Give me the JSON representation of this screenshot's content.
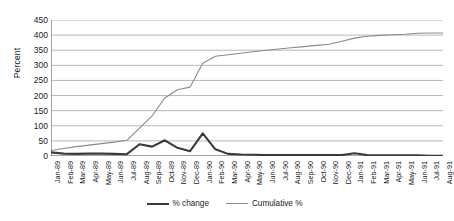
{
  "chart_data": {
    "type": "line",
    "title": "",
    "xlabel": "",
    "ylabel": "Percent",
    "ylim": [
      0,
      450
    ],
    "yticks": [
      0,
      50,
      100,
      150,
      200,
      250,
      300,
      350,
      400,
      450
    ],
    "grid": true,
    "legend_position": "bottom",
    "categories": [
      "Jan-89",
      "Feb-89",
      "Mar-89",
      "Apr-89",
      "May-89",
      "Jun-89",
      "Jul-89",
      "Aug-89",
      "Sep-89",
      "Oct-89",
      "Nov-89",
      "Dec-89",
      "Jan-90",
      "Feb-90",
      "Mar-90",
      "Apr-90",
      "May-90",
      "Jun-90",
      "Jul-90",
      "Aug-90",
      "Sep-90",
      "Oct-90",
      "Nov-90",
      "Dec-90",
      "Jan-91",
      "Feb-91",
      "Mar-91",
      "Apr-91",
      "May-91",
      "Jun-91",
      "Jul-91",
      "Aug-91"
    ],
    "series": [
      {
        "name": "% change",
        "color": "#3a3a3a",
        "width": 2.1,
        "values": [
          12,
          8,
          7,
          8,
          8,
          7,
          6,
          39,
          31,
          52,
          27,
          16,
          75,
          22,
          7,
          5,
          4,
          3,
          3,
          3,
          3,
          3,
          3,
          3,
          9,
          3,
          2,
          2,
          2,
          2,
          1,
          1
        ]
      },
      {
        "name": "Cumulative %",
        "color": "#8a8a8a",
        "width": 1.1,
        "values": [
          18,
          25,
          31,
          36,
          41,
          46,
          52,
          92,
          133,
          192,
          219,
          228,
          307,
          330,
          335,
          340,
          345,
          350,
          354,
          358,
          362,
          366,
          370,
          380,
          390,
          396,
          399,
          401,
          403,
          406,
          407,
          407
        ]
      }
    ]
  },
  "legend": {
    "entries": [
      {
        "label": "% change"
      },
      {
        "label": "Cumulative %"
      }
    ]
  }
}
